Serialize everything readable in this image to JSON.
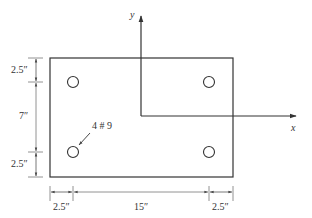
{
  "diagram": {
    "type": "rectangular column cross-section with reinforcing bars",
    "axes": {
      "x_label": "x",
      "y_label": "y"
    },
    "bar_callout": "4 # 9",
    "section": {
      "width_in": 20,
      "height_in": 12
    },
    "bars": [
      {
        "id": "top-left"
      },
      {
        "id": "top-right"
      },
      {
        "id": "bottom-left"
      },
      {
        "id": "bottom-right"
      }
    ],
    "vertical_dimensions": [
      "2.5″",
      "7″",
      "2.5″"
    ],
    "horizontal_dimensions": [
      "2.5″",
      "15″",
      "2.5″"
    ],
    "colors": {
      "line": "#333333",
      "dim_line": "#777777",
      "background": "#ffffff"
    }
  }
}
